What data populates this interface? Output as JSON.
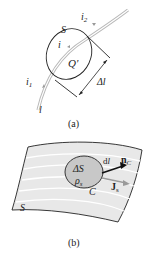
{
  "figure_a": {
    "caption": "(a)",
    "labels": {
      "surface": "S",
      "current_in": "i",
      "current_in_sub": "1",
      "current_out": "i",
      "current_out_sub": "2",
      "current_inside": "i",
      "charge": "Q'",
      "line": "l",
      "length": "Δl"
    }
  },
  "figure_b": {
    "caption": "(b)",
    "labels": {
      "area": "ΔS",
      "density": "ρ",
      "density_sub": "s",
      "contour": "C",
      "element": "dl",
      "normal": "n",
      "normal_sub": "C",
      "current_density": "J",
      "current_density_sub": "s",
      "surface": "S"
    }
  },
  "colors": {
    "line": "#222222",
    "wire": "#b0b0b0",
    "surface_fill": "#e6e6e6",
    "surface_stripes": "#ffffff",
    "patch_fill": "#c8c8c8",
    "arrow_gray": "#9a9a9a"
  }
}
